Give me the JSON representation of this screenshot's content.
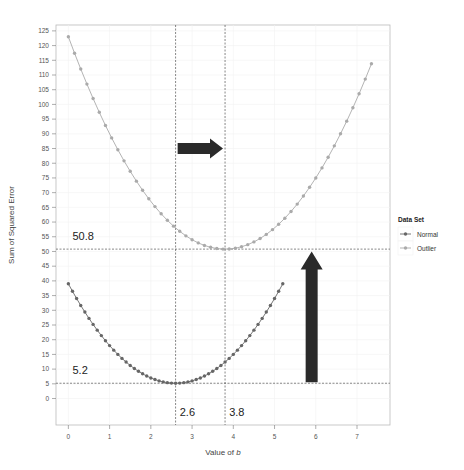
{
  "chart_data": {
    "type": "line",
    "title": "",
    "xlabel": "Value of b",
    "ylabel": "Sum of Squared Error",
    "xlim": [
      -0.3,
      7.8
    ],
    "ylim": [
      -9,
      127
    ],
    "x_ticks": [
      0,
      1,
      2,
      3,
      4,
      5,
      6,
      7
    ],
    "y_ticks": [
      0,
      5,
      10,
      15,
      20,
      25,
      30,
      35,
      40,
      45,
      50,
      55,
      60,
      65,
      70,
      75,
      80,
      85,
      90,
      95,
      100,
      105,
      110,
      115,
      120,
      125
    ],
    "grid": true,
    "legend": {
      "title": "Data Set",
      "position": "right",
      "entries": [
        "Normal",
        "Outlier"
      ]
    },
    "series": [
      {
        "name": "Normal",
        "color": "#666666",
        "b_min": 0,
        "b_max": 5.2,
        "b_step": 0.1,
        "min_b": 2.6,
        "min_sse": 5.2,
        "curvature": 5
      },
      {
        "name": "Outlier",
        "color": "#aaaaaa",
        "b_min": 0,
        "b_max": 7.45,
        "b_step": 0.15,
        "min_b": 3.8,
        "min_sse": 50.8,
        "curvature": 5
      }
    ],
    "reference_lines": {
      "horizontal": [
        5.2,
        50.8
      ],
      "vertical": [
        2.6,
        3.8
      ]
    },
    "annotations": [
      {
        "text": "50.8",
        "x": 0.1,
        "y": 54
      },
      {
        "text": "5.2",
        "x": 0.1,
        "y": 8.5
      },
      {
        "text": "2.6",
        "x": 2.7,
        "y": -6
      },
      {
        "text": "3.8",
        "x": 3.9,
        "y": -6
      }
    ],
    "arrows": [
      {
        "direction": "right",
        "from": [
          2.65,
          85
        ],
        "to": [
          3.75,
          85
        ]
      },
      {
        "direction": "up",
        "from": [
          5.9,
          5.5
        ],
        "to": [
          5.9,
          50
        ]
      }
    ]
  }
}
